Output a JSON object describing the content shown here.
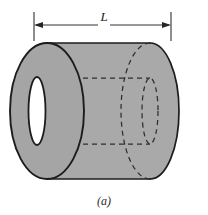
{
  "figure": {
    "caption": "(a)",
    "projection": "oblique-isometric"
  },
  "dimension": {
    "label": "L",
    "meaning": "length",
    "arrow_style": "double-headed",
    "x_start": 34,
    "x_end": 171,
    "y": 25,
    "tick_top": 12,
    "tick_bottom": 41
  },
  "geometry": {
    "front_face": {
      "name": "near-end-annulus",
      "center_x": 47,
      "center_y": 111,
      "outer_rx": 37,
      "outer_ry": 68,
      "inner_rx": 8,
      "inner_ry": 34
    },
    "far_face": {
      "name": "far-end-circle",
      "center_x": 150,
      "center_y": 111,
      "outer_rx": 29,
      "outer_ry": 66,
      "inner_rx": 8,
      "inner_ry": 32
    },
    "body": {
      "top_y": 44,
      "bottom_y": 178,
      "left_x": 47,
      "right_x": 179
    },
    "bore_lines": {
      "top_y": 78,
      "bottom_y": 144
    }
  },
  "colors": {
    "body_fill": "#a9a9a9",
    "face_fill": "#a5a5a5",
    "hole_fill": "#ffffff",
    "outline": "#1c1c1c",
    "hidden_line": "#2e2e2e",
    "dimension_line": "#303030",
    "background": "#ffffff"
  }
}
